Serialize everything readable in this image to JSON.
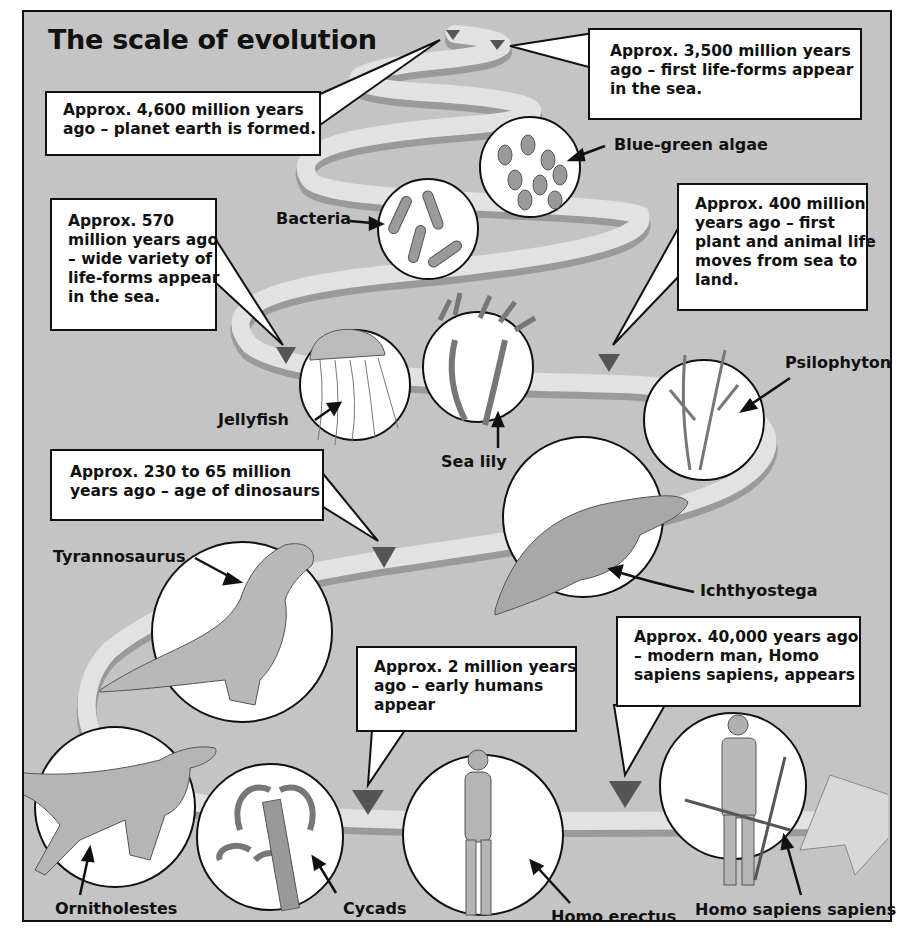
{
  "title": "The scale of evolution",
  "colors": {
    "background": "#c4c4c4",
    "path_light": "#e2e2e2",
    "path_dark": "#9a9a9a",
    "marker": "#555555",
    "box_fill": "#ffffff",
    "stroke": "#111111"
  },
  "callouts": [
    {
      "id": "earth",
      "lines": [
        "Approx. 4,600 million years",
        "ago – planet earth is formed."
      ]
    },
    {
      "id": "first-life",
      "lines": [
        "Approx. 3,500 million years",
        "ago – first life-forms appear",
        "in the sea."
      ]
    },
    {
      "id": "variety",
      "lines": [
        "Approx. 570",
        "million years ago",
        "– wide variety of",
        "life-forms appear",
        "in the sea."
      ]
    },
    {
      "id": "land",
      "lines": [
        "Approx. 400 million",
        "years ago – first",
        "plant and animal life",
        "moves from sea to",
        "land."
      ]
    },
    {
      "id": "dinosaurs",
      "lines": [
        "Approx. 230 to 65 million",
        "years ago – age of dinosaurs"
      ]
    },
    {
      "id": "early-humans",
      "lines": [
        "Approx. 2 million years",
        "ago – early humans",
        "appear"
      ]
    },
    {
      "id": "modern-man",
      "lines": [
        "Approx. 40,000 years ago",
        "– modern man, Homo",
        "sapiens sapiens, appears"
      ]
    }
  ],
  "organisms": [
    {
      "id": "blue-green-algae",
      "label": "Blue-green algae"
    },
    {
      "id": "bacteria",
      "label": "Bacteria"
    },
    {
      "id": "jellyfish",
      "label": "Jellyfish"
    },
    {
      "id": "sea-lily",
      "label": "Sea lily"
    },
    {
      "id": "psilophyton",
      "label": "Psilophyton"
    },
    {
      "id": "ichthyostega",
      "label": "Ichthyostega"
    },
    {
      "id": "tyrannosaurus",
      "label": "Tyrannosaurus"
    },
    {
      "id": "ornitholestes",
      "label": "Ornitholestes"
    },
    {
      "id": "cycads",
      "label": "Cycads"
    },
    {
      "id": "homo-erectus",
      "label": "Homo erectus"
    },
    {
      "id": "homo-sapiens-sapiens",
      "label": "Homo sapiens sapiens"
    }
  ]
}
